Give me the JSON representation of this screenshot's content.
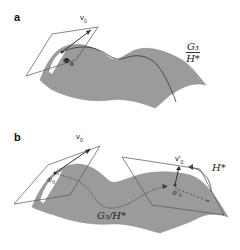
{
  "colors": {
    "surface": "#9a9a9a",
    "surface_edge": "#8a8a8a",
    "highlight": "#ffffff",
    "line": "#333333",
    "plane": "#555555"
  },
  "panel_a": {
    "letter": "a",
    "vector_label": "v",
    "vector_sub": "0",
    "point_label": "Φ",
    "point_sub": "0",
    "quotient_num": "G₃",
    "quotient_den": "H*"
  },
  "panel_b": {
    "letter": "b",
    "vector_label": "v",
    "vector_sub": "0",
    "point_label": "Φ",
    "point_sub": "0",
    "vector2_label": "v'",
    "vector2_sub": "0",
    "point2_label": "Φ'",
    "point2_sub": "0",
    "group_label": "H*",
    "quotient_label": "G₃/H*"
  }
}
